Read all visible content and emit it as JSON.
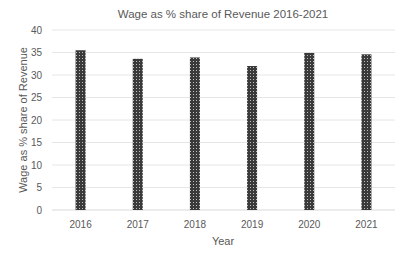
{
  "chart_data": {
    "type": "bar",
    "title": "Wage as % share of Revenue 2016-2021",
    "xlabel": "Year",
    "ylabel": "Wage as % share of Revenue",
    "categories": [
      "2016",
      "2017",
      "2018",
      "2019",
      "2020",
      "2021"
    ],
    "values": [
      35.5,
      33.6,
      33.9,
      32.0,
      34.9,
      34.6
    ],
    "ylim": [
      0,
      40
    ],
    "yticks": [
      0,
      5,
      10,
      15,
      20,
      25,
      30,
      35,
      40
    ],
    "grid": true,
    "legend": null,
    "bar_color": "#3a3a3a",
    "bar_pattern": "dotted"
  }
}
